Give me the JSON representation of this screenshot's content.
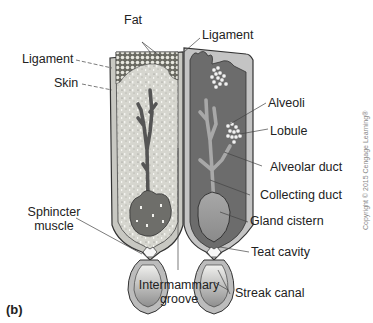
{
  "figure": {
    "panel_label": "(b)",
    "copyright": "Copyright © 2015 Cengage Learning®",
    "colors": {
      "left_fill": "#d9d9d2",
      "right_fill": "#6e6e6e",
      "cistern_fill": "#9a9a9a",
      "outline": "#2a2a2a",
      "skin": "#bdbdbd"
    }
  },
  "labels": {
    "fat": "Fat",
    "ligament_left": "Ligament",
    "ligament_top": "Ligament",
    "skin": "Skin",
    "alveoli": "Alveoli",
    "lobule": "Lobule",
    "alveolar_duct": "Alveolar duct",
    "collecting_duct": "Collecting duct",
    "gland_cistern": "Gland cistern",
    "teat_cavity": "Teat cavity",
    "sphincter_muscle_1": "Sphincter",
    "sphincter_muscle_2": "muscle",
    "intermammary_groove_1": "Intermammary",
    "intermammary_groove_2": "groove",
    "streak_canal": "Streak canal"
  }
}
